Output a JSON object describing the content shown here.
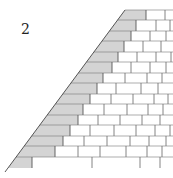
{
  "figure": {
    "label": "2",
    "colors": {
      "line": "#555555",
      "hatch": "#8a8a8a",
      "hatch_fill": "#e6e6e6",
      "background": "#ffffff"
    },
    "diagonal": {
      "top": [
        125,
        10
      ],
      "bottom": [
        5,
        172
      ]
    },
    "right_edge": 173,
    "rows": [
      {
        "y": 10,
        "joints": [
          146,
          165
        ]
      },
      {
        "y": 20,
        "joints": [
          136,
          156,
          170
        ]
      },
      {
        "y": 31,
        "joints": [
          131,
          150,
          166
        ]
      },
      {
        "y": 41,
        "joints": [
          124,
          143,
          161
        ]
      },
      {
        "y": 52,
        "joints": [
          118,
          137,
          156,
          171
        ]
      },
      {
        "y": 62,
        "joints": [
          112,
          131,
          150,
          166
        ]
      },
      {
        "y": 73,
        "joints": [
          103,
          125,
          147,
          162
        ]
      },
      {
        "y": 83,
        "joints": [
          97,
          116,
          141,
          158
        ]
      },
      {
        "y": 94,
        "joints": [
          90,
          111,
          133,
          154,
          168
        ]
      },
      {
        "y": 104,
        "joints": [
          83,
          104,
          127,
          148,
          163
        ]
      },
      {
        "y": 115,
        "joints": [
          78,
          98,
          120,
          142,
          160
        ]
      },
      {
        "y": 125,
        "joints": [
          70,
          90,
          114,
          136,
          155,
          170
        ]
      },
      {
        "y": 136,
        "joints": [
          63,
          84,
          107,
          130,
          149,
          166
        ]
      },
      {
        "y": 146,
        "joints": [
          55,
          78,
          100,
          126,
          147,
          162
        ]
      },
      {
        "y": 157,
        "joints": [
          32,
          92,
          140,
          160
        ]
      }
    ],
    "bottom_y": 168
  }
}
